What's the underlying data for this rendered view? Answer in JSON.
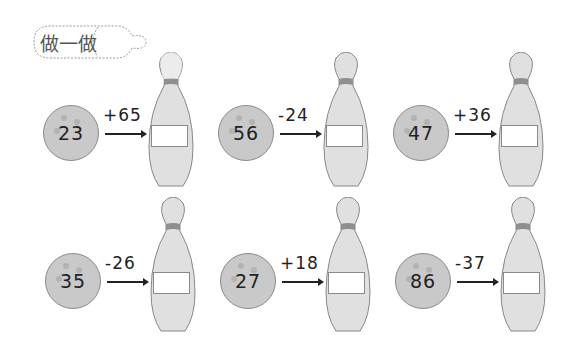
{
  "header": {
    "title": "做一做"
  },
  "colors": {
    "ball_fill": "#c9c9c9",
    "ball_stroke": "#8a8a8a",
    "pin_fill": "#e0e0e0",
    "pin_band": "#8f8f8f",
    "text": "#222222"
  },
  "problems": [
    {
      "start": "23",
      "operation": "+65",
      "answer": ""
    },
    {
      "start": "56",
      "operation": "-24",
      "answer": ""
    },
    {
      "start": "47",
      "operation": "+36",
      "answer": ""
    },
    {
      "start": "35",
      "operation": "-26",
      "answer": ""
    },
    {
      "start": "27",
      "operation": "+18",
      "answer": ""
    },
    {
      "start": "86",
      "operation": "-37",
      "answer": ""
    }
  ]
}
